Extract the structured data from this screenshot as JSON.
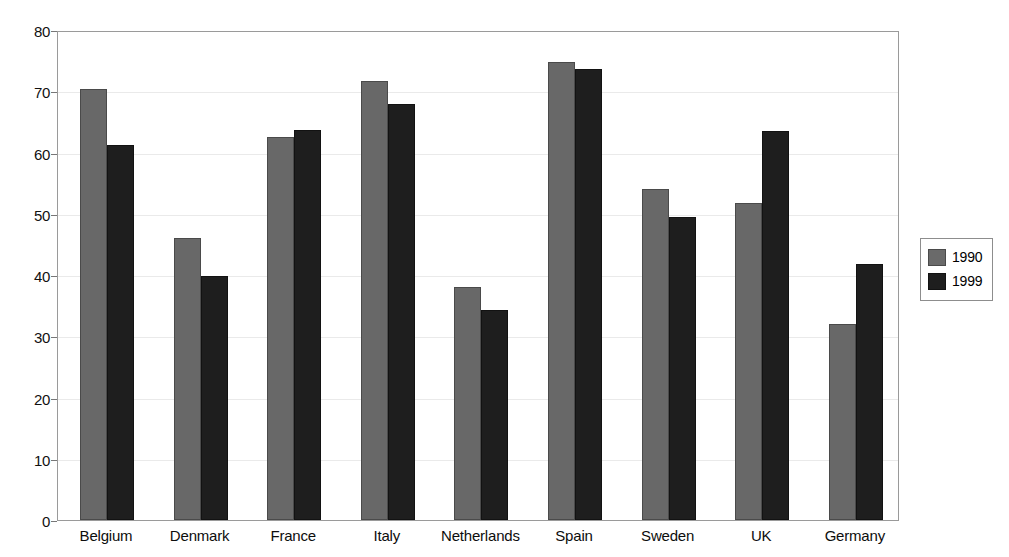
{
  "chart_data": {
    "type": "bar",
    "title": "",
    "subtitle": "",
    "xlabel": "",
    "ylabel": "",
    "ylim": [
      0,
      80
    ],
    "ytick_step": 10,
    "yticks": [
      0,
      10,
      20,
      30,
      40,
      50,
      60,
      70,
      80
    ],
    "grid": true,
    "grid_axis": "y",
    "legend_position": "right",
    "categories": [
      "Belgium",
      "Denmark",
      "France",
      "Italy",
      "Netherlands",
      "Spain",
      "Sweden",
      "UK",
      "Germany"
    ],
    "series": [
      {
        "name": "1990",
        "color": "#686868",
        "values": [
          70.4,
          46.0,
          62.5,
          71.6,
          38.0,
          74.8,
          54.1,
          51.7,
          32.0
        ]
      },
      {
        "name": "1999",
        "color": "#1e1e1e",
        "values": [
          61.2,
          39.8,
          63.6,
          68.0,
          34.3,
          73.7,
          49.5,
          63.5,
          41.8
        ]
      }
    ]
  },
  "legend": {
    "entries": [
      {
        "label": "1990",
        "swatch": "s1990"
      },
      {
        "label": "1999",
        "swatch": "s1999"
      }
    ]
  },
  "colors": {
    "series_1990": "#686868",
    "series_1999": "#1e1e1e",
    "axis": "#9a9a9a",
    "grid": "#eaeaea",
    "background": "#ffffff",
    "text": "#000000"
  }
}
